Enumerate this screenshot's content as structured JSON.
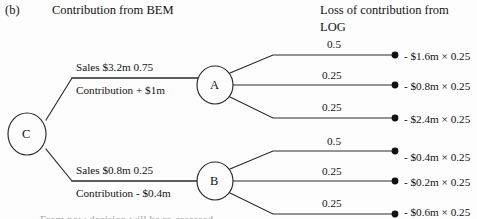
{
  "figure": {
    "panel_letter": "(b)",
    "title": "Contribution from BEM",
    "right_header_line1": "Loss of contribution from",
    "right_header_line2": "LOG",
    "footnote_cut_off": "From now decision will be re-assessed"
  },
  "nodes": [
    {
      "id": "C",
      "label": "C",
      "shape": "circle",
      "cx": 27,
      "cy": 134,
      "rx": 19,
      "ry": 21
    },
    {
      "id": "A",
      "label": "A",
      "shape": "circle",
      "cx": 215,
      "cy": 85,
      "rx": 18,
      "ry": 19
    },
    {
      "id": "B",
      "label": "B",
      "shape": "circle",
      "cx": 215,
      "cy": 181,
      "rx": 18,
      "ry": 19
    }
  ],
  "decision_branches": [
    {
      "from": "C",
      "to": "A",
      "above_label": "Sales $3.2m 0.75",
      "below_label": "Contribution + $1m",
      "sales": "$3.2m",
      "probability": "0.75",
      "contribution": "+ $1m"
    },
    {
      "from": "C",
      "to": "B",
      "above_label": "Sales $0.8m 0.25",
      "below_label": "Contribution - $0.4m",
      "sales": "$0.8m",
      "probability": "0.25",
      "contribution": "- $0.4m"
    }
  ],
  "outcome_branches": [
    {
      "from": "A",
      "probability": "0.5",
      "outcome": "- $1.6m × 0.25"
    },
    {
      "from": "A",
      "probability": "0.25",
      "outcome": "- $0.8m × 0.25"
    },
    {
      "from": "A",
      "probability": "0.25",
      "outcome": "- $2.4m × 0.25"
    },
    {
      "from": "B",
      "probability": "0.5",
      "outcome": "- $0.4m × 0.25"
    },
    {
      "from": "B",
      "probability": "0.25",
      "outcome": "- $0.2m × 0.25"
    },
    {
      "from": "B",
      "probability": "0.25",
      "outcome": "- $0.6m × 0.25"
    }
  ],
  "style": {
    "background": "#fdfdfd",
    "ink": "#121212",
    "line": "#2a2a2a"
  }
}
